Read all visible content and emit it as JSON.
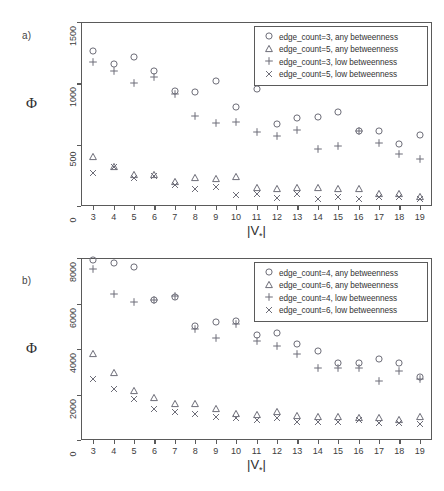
{
  "figure": {
    "panels": [
      {
        "id": "a",
        "label": "a)",
        "ylabel": "Φ",
        "xlabel_main": "|V",
        "xlabel_sub": "*",
        "xlabel_tail": "|"
      },
      {
        "id": "b",
        "label": "b)",
        "ylabel": "Φ",
        "xlabel_main": "|V",
        "xlabel_sub": "*",
        "xlabel_tail": "|"
      }
    ]
  },
  "chart_data": [
    {
      "type": "scatter",
      "panel": "a",
      "title": "",
      "xlabel": "|V*|",
      "ylabel": "Φ",
      "xlim": [
        2.4,
        19.6
      ],
      "ylim": [
        0,
        1500
      ],
      "yticks": [
        0,
        500,
        1000,
        1500
      ],
      "xticks": [
        3,
        4,
        5,
        6,
        7,
        8,
        9,
        10,
        11,
        12,
        13,
        14,
        15,
        16,
        17,
        18,
        19
      ],
      "grid": false,
      "legend_position": "top-right",
      "x": [
        3,
        4,
        5,
        6,
        7,
        8,
        9,
        10,
        11,
        12,
        13,
        14,
        15,
        16,
        17,
        18,
        19
      ],
      "series": [
        {
          "name": "edge_count=3, any betweenness",
          "marker": "circle",
          "values": [
            1265,
            1160,
            1215,
            1100,
            935,
            930,
            1015,
            810,
            950,
            665,
            715,
            725,
            765,
            615,
            610,
            505,
            580
          ]
        },
        {
          "name": "edge_count=5, any betweenness",
          "marker": "triangle",
          "values": [
            400,
            315,
            255,
            250,
            195,
            225,
            220,
            240,
            150,
            135,
            145,
            145,
            135,
            140,
            95,
            100,
            75
          ]
        },
        {
          "name": "edge_count=3, low betweenness",
          "marker": "plus",
          "values": [
            1170,
            1100,
            1000,
            1050,
            915,
            730,
            680,
            685,
            600,
            570,
            620,
            465,
            490,
            610,
            515,
            425,
            385
          ]
        },
        {
          "name": "edge_count=5, low betweenness",
          "marker": "cross",
          "values": [
            265,
            320,
            230,
            245,
            175,
            135,
            155,
            90,
            100,
            65,
            100,
            55,
            70,
            55,
            70,
            70,
            60
          ]
        }
      ],
      "legend_entries": [
        "edge_count=3, any betweenness",
        "edge_count=5, any betweenness",
        "edge_count=3, low betweenness",
        "edge_count=5, low betweenness"
      ]
    },
    {
      "type": "scatter",
      "panel": "b",
      "title": "",
      "xlabel": "|V*|",
      "ylabel": "Φ",
      "xlim": [
        2.4,
        19.6
      ],
      "ylim": [
        0,
        8000
      ],
      "yticks": [
        0,
        2000,
        4000,
        6000,
        8000
      ],
      "xticks": [
        3,
        4,
        5,
        6,
        7,
        8,
        9,
        10,
        11,
        12,
        13,
        14,
        15,
        16,
        17,
        18,
        19
      ],
      "grid": false,
      "legend_position": "top-right",
      "x": [
        3,
        4,
        5,
        6,
        7,
        8,
        9,
        10,
        11,
        12,
        13,
        14,
        15,
        16,
        17,
        18,
        19
      ],
      "series": [
        {
          "name": "edge_count=4, any betweenness",
          "marker": "circle",
          "values": [
            7900,
            7800,
            7600,
            6150,
            6300,
            5000,
            5200,
            5250,
            4600,
            4700,
            4200,
            3900,
            3400,
            3400,
            3550,
            3400,
            2750
          ]
        },
        {
          "name": "edge_count=6, any betweenness",
          "marker": "triangle",
          "values": [
            3800,
            2950,
            2150,
            1850,
            1600,
            1600,
            1350,
            1150,
            1100,
            1250,
            1050,
            1000,
            1000,
            950,
            950,
            900,
            1000
          ]
        },
        {
          "name": "edge_count=4, low betweenness",
          "marker": "plus",
          "values": [
            7500,
            6400,
            6050,
            6150,
            6350,
            4900,
            4500,
            5100,
            4350,
            4150,
            3800,
            3150,
            3150,
            3150,
            2600,
            3050,
            2700
          ]
        },
        {
          "name": "edge_count=6, low betweenness",
          "marker": "cross",
          "values": [
            2700,
            2250,
            1800,
            1350,
            1250,
            1150,
            1000,
            950,
            900,
            950,
            800,
            800,
            800,
            900,
            750,
            750,
            700
          ]
        }
      ],
      "legend_entries": [
        "edge_count=4, any betweenness",
        "edge_count=6, any betweenness",
        "edge_count=4, low betweenness",
        "edge_count=6, low betweenness"
      ]
    }
  ]
}
